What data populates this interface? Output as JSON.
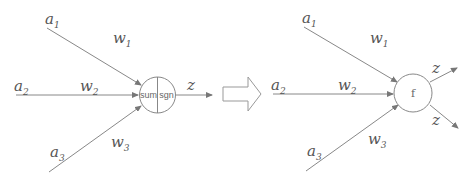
{
  "diagram": {
    "left": {
      "inputs": [
        {
          "label": "a",
          "sub": "1",
          "weight_label": "w",
          "weight_sub": "1"
        },
        {
          "label": "a",
          "sub": "2",
          "weight_label": "w",
          "weight_sub": "2"
        },
        {
          "label": "a",
          "sub": "3",
          "weight_label": "w",
          "weight_sub": "3"
        }
      ],
      "node": {
        "left_part": "sum",
        "right_part": "sgn"
      },
      "output": {
        "label": "z"
      }
    },
    "transform_arrow": {
      "icon": "hollow-right-arrow"
    },
    "right": {
      "inputs": [
        {
          "label": "a",
          "sub": "1",
          "weight_label": "w",
          "weight_sub": "1"
        },
        {
          "label": "a",
          "sub": "2",
          "weight_label": "w",
          "weight_sub": "2"
        },
        {
          "label": "a",
          "sub": "3",
          "weight_label": "w",
          "weight_sub": "3"
        }
      ],
      "node": {
        "label": "f"
      },
      "outputs": [
        {
          "label": "z"
        },
        {
          "label": "z"
        }
      ]
    },
    "colors": {
      "line": "#888888",
      "text": "#555555",
      "background": "#ffffff"
    }
  }
}
